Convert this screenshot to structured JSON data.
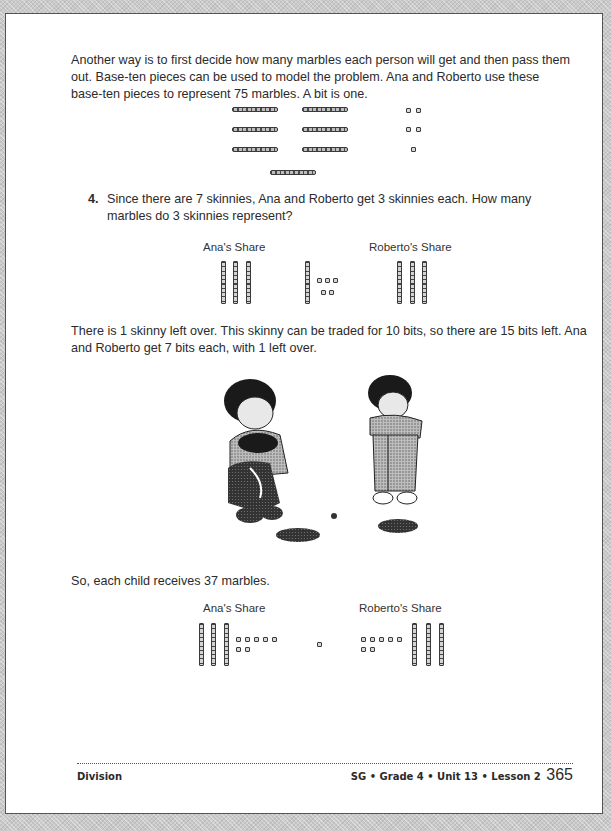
{
  "document": {
    "paragraph_1": "Another way is to first decide how many marbles each person will get and then pass them out. Base-ten pieces can be used to model the problem. Ana and Roberto use these base-ten pieces to represent 75 marbles. A bit is one.",
    "question_4": {
      "number": "4.",
      "text": "Since there are 7 skinnies, Ana and Roberto get 3 skinnies each. How many marbles do 3 skinnies represent?"
    },
    "figure_1": {
      "description": "7 skinnies and 5 bits representing 75",
      "skinnies": 7,
      "bits": 5
    },
    "figure_2": {
      "ana_label": "Ana's Share",
      "roberto_label": "Roberto's Share",
      "ana_skinnies": 3,
      "roberto_skinnies": 3,
      "leftover_skinnies": 1,
      "leftover_bits": 5
    },
    "paragraph_2": "There is 1 skinny left over. This skinny can be traded for 10 bits, so there are 15 bits left. Ana and Roberto get 7 bits each, with 1 left over.",
    "illustration": "Ana and Roberto sitting with piles of marbles",
    "paragraph_3": "So, each child receives 37 marbles.",
    "figure_3": {
      "ana_label": "Ana's Share",
      "roberto_label": "Roberto's Share",
      "ana_skinnies": 3,
      "ana_bits": 7,
      "leftover_bits": 1,
      "roberto_skinnies": 3,
      "roberto_bits": 7
    }
  },
  "footer": {
    "section": "Division",
    "course_info": "SG • Grade 4 • Unit 13 • Lesson 2",
    "page_number": "365"
  }
}
